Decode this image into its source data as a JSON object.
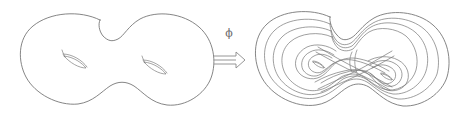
{
  "figure": {
    "background_color": "#ffffff",
    "stroke_color": "#6f6f6f",
    "width": 453,
    "height": 121,
    "map_label": "ϕ",
    "map_label_name": "phi",
    "arrow": {
      "glyph": "⟹",
      "direction": "right",
      "style": "double-line-outline"
    },
    "panels": [
      {
        "id": "source",
        "name": "source-surface",
        "description": "Genus-2 orientable surface (double torus) outline with two handle holes",
        "genus": 2,
        "holes": 2,
        "curves_drawn": 0
      },
      {
        "id": "target",
        "name": "target-surface",
        "description": "Genus-2 surface carrying an embedded curve winding as nested spirals through both handles",
        "genus": 2,
        "holes": 2,
        "curves_drawn": 1,
        "winding_pattern": "figure-eight nested spiral"
      }
    ]
  }
}
